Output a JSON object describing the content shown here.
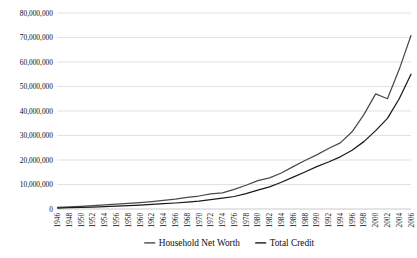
{
  "chart_data": {
    "type": "line",
    "title": "",
    "xlabel": "",
    "ylabel": "",
    "ylim": [
      0,
      80000000
    ],
    "ytick_values": [
      0,
      10000000,
      20000000,
      30000000,
      40000000,
      50000000,
      60000000,
      70000000,
      80000000
    ],
    "ytick_labels": [
      "0",
      "10,000,000",
      "20,000,000",
      "30,000,000",
      "40,000,000",
      "50,000,000",
      "60,000,000",
      "70,000,000",
      "80,000,000"
    ],
    "grid": true,
    "legend_position": "bottom",
    "categories": [
      1946,
      1948,
      1950,
      1952,
      1954,
      1956,
      1958,
      1960,
      1962,
      1964,
      1966,
      1968,
      1970,
      1972,
      1974,
      1976,
      1978,
      1980,
      1982,
      1984,
      1986,
      1988,
      1990,
      1992,
      1994,
      1996,
      1998,
      2000,
      2002,
      2004,
      2006
    ],
    "xtick_labels": [
      "1946",
      "1948",
      "1950",
      "1952",
      "1954",
      "1956",
      "1958",
      "1960",
      "1962",
      "1964",
      "1966",
      "1968",
      "1970",
      "1972",
      "1974",
      "1976",
      "1978",
      "1980",
      "1982",
      "1984",
      "1986",
      "1988",
      "1990",
      "1992",
      "1994",
      "1996",
      "1998",
      "2000",
      "2002",
      "2004",
      "2006"
    ],
    "series": [
      {
        "name": "Household Net Worth",
        "color": "#4a4a4a",
        "width": 1.25,
        "values": [
          700000,
          900000,
          1100000,
          1350000,
          1650000,
          2000000,
          2300000,
          2650000,
          3050000,
          3550000,
          4000000,
          4700000,
          5300000,
          6200000,
          6600000,
          8000000,
          9700000,
          11600000,
          12700000,
          14700000,
          17300000,
          19800000,
          22100000,
          24700000,
          27000000,
          31500000,
          38500000,
          47000000,
          45000000,
          57000000,
          70800000
        ]
      },
      {
        "name": "Total Credit",
        "color": "#1a1a1a",
        "width": 1.25,
        "values": [
          400000,
          520000,
          640000,
          800000,
          980000,
          1180000,
          1380000,
          1600000,
          1850000,
          2150000,
          2450000,
          2850000,
          3250000,
          3800000,
          4400000,
          5100000,
          6300000,
          7700000,
          9000000,
          10900000,
          13000000,
          15100000,
          17300000,
          19200000,
          21300000,
          24000000,
          27500000,
          32000000,
          37000000,
          45000000,
          55000000
        ]
      }
    ]
  },
  "legend": {
    "items": [
      {
        "label": "Household Net Worth",
        "color": "#4a4a4a"
      },
      {
        "label": "Total Credit",
        "color": "#1a1a1a"
      }
    ]
  }
}
